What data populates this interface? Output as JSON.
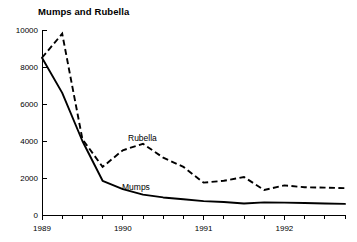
{
  "chart_data": {
    "type": "line",
    "title": "Mumps and Rubella",
    "xlabel": "",
    "ylabel": "",
    "grid": false,
    "legend_position": "inline-annotation",
    "ylim": [
      0,
      10000
    ],
    "yticks": [
      0,
      2000,
      4000,
      6000,
      8000,
      10000
    ],
    "ytick_labels": [
      "0",
      "2000",
      "4000",
      "6000",
      "8000",
      "10000"
    ],
    "xlim": [
      1989.0,
      1992.75
    ],
    "xticks": [
      1989,
      1990,
      1991,
      1992
    ],
    "xtick_labels": [
      "1989",
      "1990",
      "1991",
      "1992"
    ],
    "minor_xticks_per_interval": 3,
    "x": [
      1989.0,
      1989.25,
      1989.5,
      1989.75,
      1990.0,
      1990.25,
      1990.5,
      1990.75,
      1991.0,
      1991.25,
      1991.5,
      1991.75,
      1992.0,
      1992.25,
      1992.5,
      1992.75
    ],
    "series": [
      {
        "name": "Rubella",
        "style": "dashed",
        "color": "#000000",
        "annotation_label": "Rubella",
        "values": [
          8500,
          9800,
          4100,
          2600,
          3500,
          3850,
          3100,
          2600,
          1750,
          1850,
          2050,
          1350,
          1600,
          1500,
          1480,
          1450
        ]
      },
      {
        "name": "Mumps",
        "style": "solid",
        "color": "#000000",
        "annotation_label": "Mumps",
        "values": [
          8500,
          6600,
          4000,
          1850,
          1400,
          1100,
          950,
          850,
          750,
          700,
          620,
          680,
          670,
          650,
          620,
          600
        ]
      }
    ]
  },
  "annotations": {
    "rubella_label": "Rubella",
    "mumps_label": "Mumps"
  }
}
